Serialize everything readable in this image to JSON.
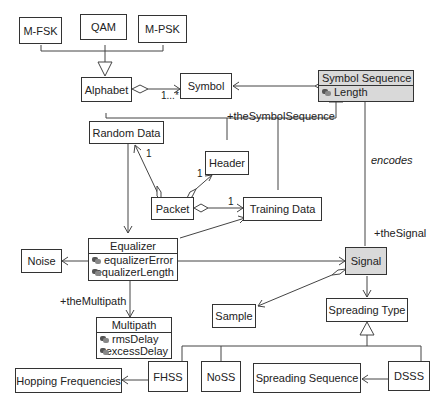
{
  "diagram": {
    "type": "UML class diagram",
    "classes": {
      "mfsk": {
        "name": "M-FSK"
      },
      "qam": {
        "name": "QAM"
      },
      "mpsk": {
        "name": "M-PSK"
      },
      "alphabet": {
        "name": "Alphabet"
      },
      "symbol": {
        "name": "Symbol"
      },
      "symbol_sequence": {
        "name": "Symbol Sequence",
        "attributes": [
          "Length"
        ]
      },
      "random_data": {
        "name": "Random Data"
      },
      "header": {
        "name": "Header"
      },
      "packet": {
        "name": "Packet"
      },
      "training_data": {
        "name": "Training Data"
      },
      "equalizer": {
        "name": "Equalizer",
        "attributes": [
          "equalizerError",
          "equalizerLength"
        ]
      },
      "noise": {
        "name": "Noise"
      },
      "signal": {
        "name": "Signal"
      },
      "sample": {
        "name": "Sample"
      },
      "spreading_type": {
        "name": "Spreading Type"
      },
      "multipath": {
        "name": "Multipath",
        "attributes": [
          "rmsDelay",
          "excessDelay"
        ]
      },
      "hopping_frequencies": {
        "name": "Hopping Frequencies"
      },
      "fhss": {
        "name": "FHSS"
      },
      "noss": {
        "name": "NoSS"
      },
      "spreading_sequence": {
        "name": "Spreading Sequence"
      },
      "dsss": {
        "name": "DSSS"
      }
    },
    "labels": {
      "alphabet_symbol_multiplicity": "1...*",
      "the_symbol_sequence": "+theSymbolSequence",
      "packet_random_data_multiplicity": "1",
      "packet_header_multiplicity": "1",
      "packet_training_data_multiplicity": "1",
      "encodes": "encodes",
      "the_signal": "+theSignal",
      "the_multipath": "+theMultipath"
    },
    "relationships": [
      {
        "from": "M-FSK",
        "to": "Alphabet",
        "type": "generalization"
      },
      {
        "from": "QAM",
        "to": "Alphabet",
        "type": "generalization"
      },
      {
        "from": "M-PSK",
        "to": "Alphabet",
        "type": "generalization"
      },
      {
        "from": "Alphabet",
        "to": "Symbol",
        "type": "aggregation",
        "multiplicity": "1...*"
      },
      {
        "from": "Symbol Sequence",
        "to": "Symbol",
        "type": "aggregation"
      },
      {
        "from": "Random Data",
        "to": "Symbol Sequence",
        "type": "generalization",
        "role": "+theSymbolSequence"
      },
      {
        "from": "Header",
        "to": "Symbol Sequence",
        "type": "generalization"
      },
      {
        "from": "Training Data",
        "to": "Symbol Sequence",
        "type": "generalization"
      },
      {
        "from": "Packet",
        "to": "Random Data",
        "type": "aggregation",
        "multiplicity": "1"
      },
      {
        "from": "Packet",
        "to": "Header",
        "type": "aggregation",
        "multiplicity": "1"
      },
      {
        "from": "Packet",
        "to": "Training Data",
        "type": "aggregation",
        "multiplicity": "1"
      },
      {
        "from": "Random Data",
        "to": "Equalizer",
        "type": "association"
      },
      {
        "from": "Equalizer",
        "to": "Training Data",
        "type": "association"
      },
      {
        "from": "Equalizer",
        "to": "Noise",
        "type": "association"
      },
      {
        "from": "Equalizer",
        "to": "Signal",
        "type": "association"
      },
      {
        "from": "Equalizer",
        "to": "Multipath",
        "type": "association",
        "role": "+theMultipath"
      },
      {
        "from": "Symbol Sequence",
        "to": "Signal",
        "type": "association",
        "label": "encodes",
        "role": "+theSignal"
      },
      {
        "from": "Signal",
        "to": "Sample",
        "type": "aggregation"
      },
      {
        "from": "Signal",
        "to": "Spreading Type",
        "type": "association"
      },
      {
        "from": "FHSS",
        "to": "Spreading Type",
        "type": "generalization"
      },
      {
        "from": "NoSS",
        "to": "Spreading Type",
        "type": "generalization"
      },
      {
        "from": "DSSS",
        "to": "Spreading Type",
        "type": "generalization"
      },
      {
        "from": "FHSS",
        "to": "Hopping Frequencies",
        "type": "association"
      },
      {
        "from": "DSSS",
        "to": "Spreading Sequence",
        "type": "association"
      }
    ],
    "colors": {
      "shaded_fill": "#d9d9d9",
      "line": "#444444",
      "background": "#ffffff"
    }
  }
}
